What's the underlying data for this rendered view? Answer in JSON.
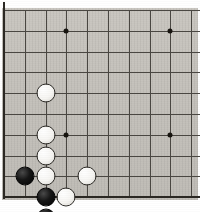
{
  "figure": {
    "kind": "go-board-diagram",
    "board_size": 19,
    "view": "lower-left corner",
    "columns_shown": 10,
    "rows_shown": 10
  },
  "board": {
    "origin_x": 4,
    "origin_y": 10,
    "spacing": 20.8,
    "cols": 10,
    "rows": 10,
    "surface_color": "#c4c1bb",
    "line_color": "#4a4742",
    "edge_color": "#2b2823",
    "edges": {
      "left": true,
      "bottom": true,
      "top": false,
      "right": false
    }
  },
  "star_points": [
    {
      "name": "star-point-upper-left",
      "col": 3,
      "row": 1
    },
    {
      "name": "star-point-upper-right",
      "col": 8,
      "row": 1
    },
    {
      "name": "star-point-lower-left",
      "col": 3,
      "row": 6
    },
    {
      "name": "star-point-lower-right",
      "col": 8,
      "row": 6
    }
  ],
  "stones": [
    {
      "name": "stone-white-1",
      "color": "white",
      "col": 2,
      "row": 4
    },
    {
      "name": "stone-white-2",
      "color": "white",
      "col": 2,
      "row": 6
    },
    {
      "name": "stone-white-3",
      "color": "white",
      "col": 2,
      "row": 7
    },
    {
      "name": "stone-black-1",
      "color": "black",
      "col": 1,
      "row": 8
    },
    {
      "name": "stone-white-4",
      "color": "white",
      "col": 2,
      "row": 8
    },
    {
      "name": "stone-white-5",
      "color": "white",
      "col": 4,
      "row": 8
    },
    {
      "name": "stone-black-2",
      "color": "black",
      "col": 2,
      "row": 9
    },
    {
      "name": "stone-white-6",
      "color": "white",
      "col": 3,
      "row": 9
    },
    {
      "name": "stone-black-3",
      "color": "black",
      "col": 2,
      "row": 10
    }
  ],
  "stone_style": {
    "diameter": 19,
    "black_fill": "#101010",
    "white_fill": "#f7f6f3",
    "white_outline": "#2e2c28"
  }
}
